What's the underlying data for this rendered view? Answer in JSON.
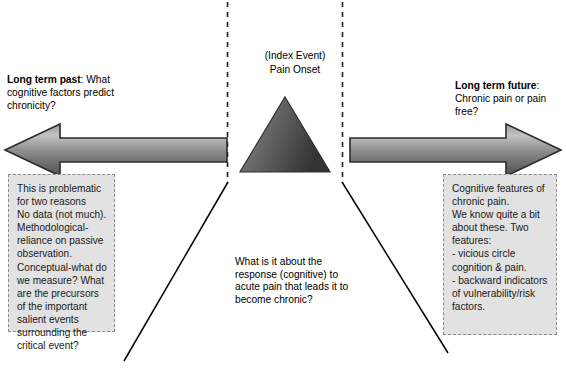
{
  "diagram": {
    "title_center": "(Index Event)\nPain Onset",
    "left_heading_bold": "Long term past",
    "left_heading_rest": ": What cognitive factors predict chronicity?",
    "right_heading_bold": "Long term future",
    "right_heading_rest": ": Chronic pain or pain free?",
    "center_question": "What is it about the response (cognitive) to acute pain that leads it to become chronic?",
    "left_panel_text": "This is problematic for two reasons\nNo data (not much).\nMethodological-reliance on passive observation.\nConceptual-what do we measure? What are the precursors of the important salient events surrounding the critical event?",
    "right_panel_text": "Cognitive features of chronic pain.\nWe know quite a bit about these. Two features:\n- vicious circle cognition & pain.\n- backward indicators of vulnerability/risk factors.",
    "bottom_cut_text": "",
    "colors": {
      "panel_fill": "#e2e2e2",
      "panel_border": "#8c8c8c",
      "arrow_light": "#b8b8b8",
      "arrow_dark": "#4a4a4a",
      "arrow_outline": "#2b2b2b",
      "triangle_light": "#8f8f8f",
      "triangle_dark": "#3a3a3a",
      "dashed_line": "#222222",
      "diagonal_line": "#000000",
      "text": "#000000",
      "background": "#ffffff"
    },
    "shapes": {
      "left_arrow_name": "left-pointing-arrow-past",
      "right_arrow_name": "right-pointing-arrow-future",
      "triangle_name": "index-event-triangle",
      "left_dashed_line_name": "left-boundary-dashed-line",
      "right_dashed_line_name": "right-boundary-dashed-line",
      "left_diagonal_name": "left-diverging-line",
      "right_diagonal_name": "right-diverging-line"
    }
  }
}
